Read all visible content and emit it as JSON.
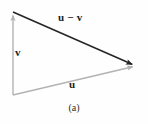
{
  "figure": {
    "caption": "(a)",
    "background_color": "#fefefe",
    "width": 148,
    "height": 124
  },
  "labels": {
    "u_minus_v": "u − v",
    "v": "v",
    "u": "u"
  },
  "colors": {
    "dark_vector": "#262626",
    "light_vector": "#b3b3b3",
    "label_text": "#1c1c1c",
    "caption_text": "#2a2a2a"
  },
  "chart_data": {
    "type": "diagram",
    "title": "(a)",
    "subtitle": "",
    "xlabel": "",
    "ylabel": "",
    "coordinate_space": {
      "width": 148,
      "height": 124,
      "y_axis": "down"
    },
    "points": [
      {
        "name": "origin",
        "x": 13,
        "y": 95
      },
      {
        "name": "tip_of_v",
        "x": 13,
        "y": 12
      },
      {
        "name": "tip_of_u",
        "x": 136,
        "y": 66
      }
    ],
    "vectors": [
      {
        "name": "v",
        "label": "v",
        "from": [
          13,
          95
        ],
        "to": [
          13,
          12
        ],
        "color": "#b3b3b3",
        "stroke_width": 1.4,
        "arrowhead": "filled-triangle",
        "label_position": [
          15,
          52
        ]
      },
      {
        "name": "u",
        "label": "u",
        "from": [
          13,
          95
        ],
        "to": [
          136,
          66
        ],
        "color": "#b3b3b3",
        "stroke_width": 1.4,
        "arrowhead": "filled-triangle",
        "label_position": [
          73,
          84
        ]
      },
      {
        "name": "u_minus_v",
        "label": "u − v",
        "from": [
          13,
          12
        ],
        "to": [
          136,
          66
        ],
        "color": "#262626",
        "stroke_width": 1.6,
        "arrowhead": "filled-triangle",
        "label_position": [
          72,
          18
        ]
      }
    ],
    "legend": [],
    "grid": false
  }
}
